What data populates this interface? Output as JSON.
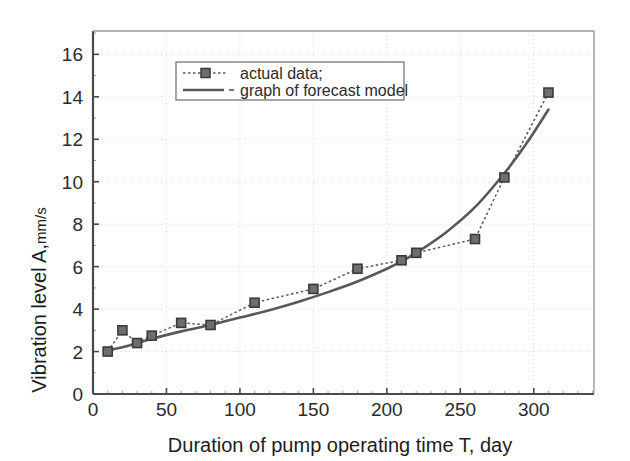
{
  "chart_data": {
    "type": "line",
    "title": "",
    "xlabel": "Duration of pump operating time T, day",
    "ylabel_main": "Vibration level A,",
    "ylabel_unit": "mm/s",
    "xlim": [
      0,
      341
    ],
    "ylim": [
      0,
      17.1
    ],
    "xticks": [
      0,
      50,
      100,
      150,
      200,
      250,
      300
    ],
    "yticks": [
      0,
      2,
      4,
      6,
      8,
      10,
      12,
      14,
      16
    ],
    "xtick_labels": [
      "0",
      "50",
      "100",
      "150",
      "200",
      "250",
      "300"
    ],
    "ytick_labels": [
      "0",
      "2",
      "4",
      "6",
      "8",
      "10",
      "12",
      "14",
      "16"
    ],
    "grid": true,
    "grid_color": "#d8d8d8",
    "axis_color": "#4a4a4a",
    "legend_position": "top-left-inside",
    "series": [
      {
        "name": "actual data;",
        "style": "dotted-with-square-markers",
        "color": "#595959",
        "marker_fill": "#6e6e6e",
        "marker_edge": "#3a3a3a",
        "x": [
          10,
          20,
          30,
          40,
          60,
          80,
          110,
          150,
          180,
          210,
          220,
          260,
          280,
          310
        ],
        "values": [
          2.0,
          3.0,
          2.4,
          2.75,
          3.35,
          3.25,
          4.3,
          4.95,
          5.9,
          6.3,
          6.65,
          7.3,
          10.2,
          14.2
        ]
      },
      {
        "name": "graph of forecast model",
        "style": "solid",
        "color": "#585858",
        "x": [
          10,
          20,
          30,
          40,
          60,
          80,
          100,
          120,
          140,
          160,
          180,
          200,
          210,
          220,
          240,
          260,
          280,
          295,
          310
        ],
        "values": [
          2.05,
          2.2,
          2.4,
          2.6,
          2.95,
          3.25,
          3.6,
          3.95,
          4.35,
          4.8,
          5.3,
          5.9,
          6.25,
          6.65,
          7.6,
          8.8,
          10.4,
          11.8,
          13.4
        ]
      }
    ]
  },
  "legend": {
    "entries": [
      {
        "label": "actual data;",
        "marker": "dotted-square-marker"
      },
      {
        "label": "graph of forecast model",
        "marker": "solid-line-marker"
      }
    ]
  }
}
